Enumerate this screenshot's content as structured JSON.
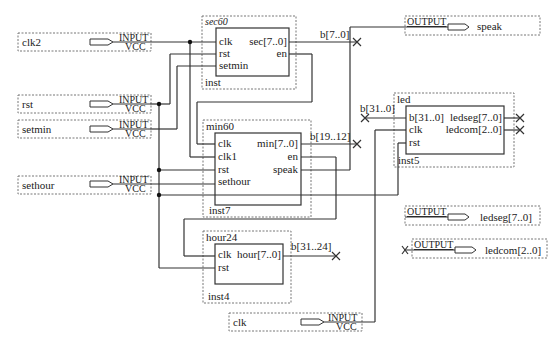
{
  "inputs": [
    {
      "name": "clk2",
      "type": "INPUT",
      "sub": "VCC"
    },
    {
      "name": "rst",
      "type": "INPUT",
      "sub": "VCC"
    },
    {
      "name": "setmin",
      "type": "INPUT",
      "sub": "VCC"
    },
    {
      "name": "sethour",
      "type": "INPUT",
      "sub": "VCC"
    },
    {
      "name": "clk",
      "type": "INPUT",
      "sub": "VCC"
    }
  ],
  "outputs": [
    {
      "name": "speak",
      "type": "OUTPUT"
    },
    {
      "name": "ledseg[7..0]",
      "type": "OUTPUT"
    },
    {
      "name": "ledcom[2..0]",
      "type": "OUTPUT"
    }
  ],
  "blocks": {
    "sec60": {
      "title": "sec60",
      "inst": "inst",
      "left_ports": [
        "clk",
        "rst",
        "setmin"
      ],
      "right_ports": [
        "sec[7..0]",
        "en"
      ]
    },
    "min60": {
      "title": "min60",
      "inst": "inst7",
      "left_ports": [
        "clk",
        "clk1",
        "rst",
        "sethour"
      ],
      "right_ports": [
        "min[7..0]",
        "en",
        "speak"
      ]
    },
    "hour24": {
      "title": "hour24",
      "inst": "inst4",
      "left_ports": [
        "clk",
        "rst"
      ],
      "right_ports": [
        "hour[7..0]"
      ]
    },
    "led": {
      "title": "led",
      "inst": "inst5",
      "left_ports": [
        "b[31..0]",
        "clk",
        "rst"
      ],
      "right_ports": [
        "ledseg[7..0]",
        "ledcom[2..0]"
      ]
    }
  },
  "bus_labels": {
    "sec_bus": "b[7..0]",
    "min_bus": "b[19..12]",
    "hour_bus": "b[31..24]",
    "led_bus": "b[31..0]"
  }
}
